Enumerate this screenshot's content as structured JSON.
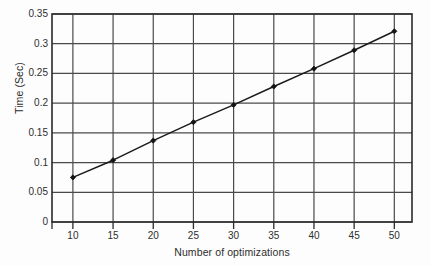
{
  "chart_data": {
    "type": "line",
    "title": "",
    "subtitle": "",
    "xlabel": "Number of optimizations",
    "ylabel": "Time (Sec)",
    "x": [
      10,
      15,
      20,
      25,
      30,
      35,
      40,
      45,
      50
    ],
    "y": [
      0.075,
      0.104,
      0.137,
      0.168,
      0.197,
      0.228,
      0.258,
      0.289,
      0.321
    ],
    "series": [
      {
        "name": "Time",
        "x": [
          10,
          15,
          20,
          25,
          30,
          35,
          40,
          45,
          50
        ],
        "values": [
          0.075,
          0.104,
          0.137,
          0.168,
          0.197,
          0.228,
          0.258,
          0.289,
          0.321
        ]
      }
    ],
    "xlim": [
      7.4,
      52.2
    ],
    "ylim": [
      0,
      0.35
    ],
    "xticks": [
      10,
      15,
      20,
      25,
      30,
      35,
      40,
      45,
      50
    ],
    "yticks": [
      0,
      0.05,
      0.1,
      0.15,
      0.2,
      0.25,
      0.3,
      0.35
    ],
    "xtick_labels": [
      "10",
      "15",
      "20",
      "25",
      "30",
      "35",
      "40",
      "45",
      "50"
    ],
    "ytick_labels": [
      "0",
      "0.05",
      "0.1",
      "0.15",
      "0.2",
      "0.25",
      "0.3",
      "0.35"
    ],
    "grid": true,
    "grid_axes": "both",
    "legend": false,
    "legend_position": "none",
    "marker": "filled-diamond",
    "line_style": "solid",
    "colors": {
      "line": "#1a1a1a",
      "marker": "#141414",
      "grid": "#4a4a4a",
      "axis": "#2a2a2a",
      "background": "#fdfdfd",
      "text": "#2e2e2e"
    }
  }
}
